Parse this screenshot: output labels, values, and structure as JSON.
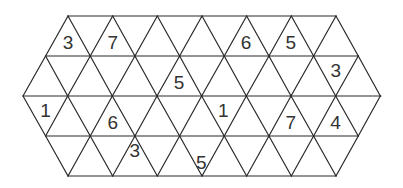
{
  "puzzle": {
    "type": "triangular-grid-number-puzzle",
    "rows": 4,
    "line_color": "#2a2a2a",
    "text_color": "#333333",
    "background": "#ffffff",
    "geometry": {
      "unit": 44.7,
      "row_height": 40,
      "top_y": 16,
      "row_extents": [
        {
          "y": 16,
          "x_left": 68,
          "x_right": 336
        },
        {
          "y": 56,
          "x_left": 45.6,
          "x_right": 358.4
        },
        {
          "y": 96,
          "x_left": 23,
          "x_right": 381
        },
        {
          "y": 136,
          "x_left": 45.6,
          "x_right": 358.4
        },
        {
          "y": 176,
          "x_left": 68,
          "x_right": 336
        }
      ]
    },
    "clues": [
      {
        "row": 0,
        "orientation": "up",
        "apex_x": 68,
        "value": "3"
      },
      {
        "row": 0,
        "orientation": "up",
        "apex_x": 112.7,
        "value": "7"
      },
      {
        "row": 0,
        "orientation": "up",
        "apex_x": 246.1,
        "value": "6"
      },
      {
        "row": 0,
        "orientation": "up",
        "apex_x": 290.8,
        "value": "5"
      },
      {
        "row": 1,
        "orientation": "up",
        "apex_x": 179.1,
        "value": "5"
      },
      {
        "row": 1,
        "orientation": "down",
        "center_x": 335.8,
        "value": "3"
      },
      {
        "row": 2,
        "orientation": "down",
        "center_x": 45.6,
        "value": "1"
      },
      {
        "row": 2,
        "orientation": "up",
        "apex_x": 112.7,
        "value": "6"
      },
      {
        "row": 2,
        "orientation": "down",
        "center_x": 223.4,
        "value": "1"
      },
      {
        "row": 2,
        "orientation": "up",
        "apex_x": 290.8,
        "value": "7"
      },
      {
        "row": 2,
        "orientation": "up",
        "apex_x": 335.5,
        "value": "4"
      },
      {
        "row": 3,
        "orientation": "down",
        "center_x": 134.8,
        "value": "3"
      },
      {
        "row": 3,
        "orientation": "up",
        "apex_x": 201.4,
        "value": "5"
      }
    ]
  }
}
